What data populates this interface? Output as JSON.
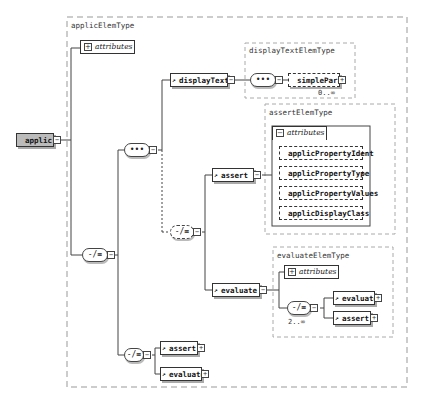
{
  "diagram": {
    "root": {
      "label": "applic"
    },
    "type_box": {
      "label": "applicElemType"
    },
    "attributes_label": "attributes",
    "sequence_glyph": "•••",
    "choice_glyph": "-/≡",
    "display_text": {
      "label": "displayText",
      "type_label": "displayTextElemType",
      "child": "simplePara",
      "cardinality": "0..∞"
    },
    "assert": {
      "label": "assert",
      "type_label": "assertElemType",
      "attributes": [
        "applicPropertyIdent",
        "applicPropertyType",
        "applicPropertyValues",
        "applicDisplayClass"
      ]
    },
    "evaluate": {
      "label": "evaluate",
      "type_label": "evaluateElemType",
      "children": [
        "evaluate",
        "assert"
      ],
      "cardinality": "2..∞"
    },
    "bottom_choice": {
      "children": [
        "assert",
        "evaluate"
      ]
    }
  },
  "colors": {
    "root_fill": "#bbbbbb",
    "line": "#333333",
    "dashed_box": "#999999"
  }
}
